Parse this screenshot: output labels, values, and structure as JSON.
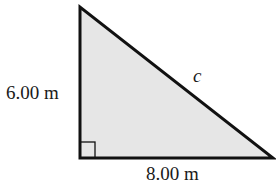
{
  "diagram": {
    "type": "right-triangle",
    "fill_color": "#e6e6e6",
    "stroke_color": "#111111",
    "vertices": {
      "top": [
        80,
        7
      ],
      "right_angle": [
        80,
        158
      ],
      "bottom_right": [
        273,
        158
      ]
    },
    "labels": {
      "vertical_leg": "6.00 m",
      "horizontal_leg": "8.00 m",
      "hypotenuse": "c"
    },
    "right_angle_marker": true
  }
}
